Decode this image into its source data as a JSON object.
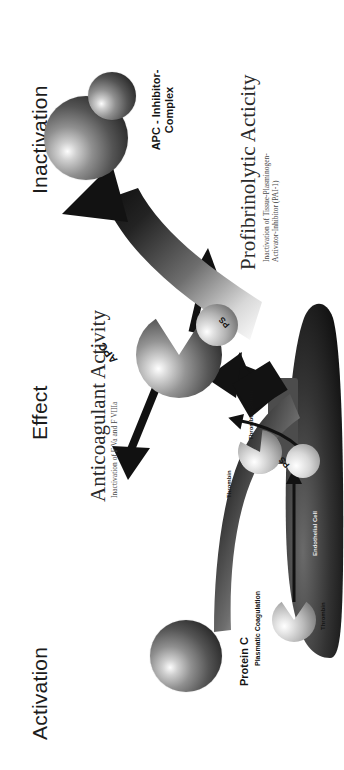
{
  "figure": {
    "orientation": "rotated-90-ccw",
    "headers": [
      {
        "id": "activation",
        "label": "Activation"
      },
      {
        "id": "effect",
        "label": "Effect"
      },
      {
        "id": "inactivation",
        "label": "Inactivation"
      }
    ],
    "effects": [
      {
        "id": "anticoagulant",
        "title": "Anticoagulant Activity",
        "subtitle": "Inactivation of F Va and F VIIIa"
      },
      {
        "id": "profibrinolytic",
        "title": "Profibrinolytic Acticity",
        "subtitle_line1": "Inactivation of Tissue-Plasminogen-",
        "subtitle_line2": "Activator-Inhibitor (PAI-1)"
      }
    ],
    "labels": {
      "protein_c": "Protein C",
      "apc": "APC",
      "ps_membrane": "PS",
      "ps_free": "PS",
      "apc_inhibitor_line1": "APC - Inhibitor-",
      "apc_inhibitor_line2": "Complex",
      "plasmatic_coagulation": "Plasmatic Coagulation",
      "thrombin_free": "Thrombin",
      "thrombin_bound": "Thrombin",
      "thrombomodulin": "Thrombomodulin",
      "endothelial_cell": "Endothelial Cell"
    },
    "colors": {
      "background": "#ffffff",
      "text": "#1a1a1a",
      "arrow": "#111111",
      "sphere_dark": "#3a3a3a",
      "sphere_light": "#d9d9d9"
    }
  }
}
